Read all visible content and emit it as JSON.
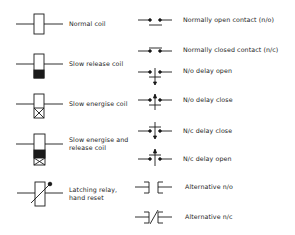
{
  "colors": {
    "ink": "#1a1a1a",
    "background": "#ffffff"
  },
  "coils": [
    {
      "id": "normal-coil",
      "label": "Normal coil"
    },
    {
      "id": "slow-release-coil",
      "label": "Slow release coil"
    },
    {
      "id": "slow-energise-coil",
      "label": "Slow energise coil"
    },
    {
      "id": "slow-energise-release-coil",
      "label_line1": "Slow energise and",
      "label_line2": "release coil"
    },
    {
      "id": "latching-relay",
      "label_line1": "Latching relay,",
      "label_line2": "hand reset"
    }
  ],
  "contacts": [
    {
      "id": "no-contact",
      "label": "Normally open contact (n/o)"
    },
    {
      "id": "nc-contact",
      "label": "Normally closed contact (n/c)"
    },
    {
      "id": "no-delay-open",
      "label": "N/o  delay open"
    },
    {
      "id": "no-delay-close",
      "label": "N/o  delay close"
    },
    {
      "id": "nc-delay-close",
      "label": "N/c  delay  close"
    },
    {
      "id": "nc-delay-open",
      "label": "N/c  delay open"
    },
    {
      "id": "alt-no",
      "label": "Alternative  n/o"
    },
    {
      "id": "alt-nc",
      "label": "Alternative  n/c"
    }
  ]
}
